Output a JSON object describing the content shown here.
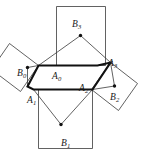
{
  "figure": {
    "kind": "geometry-diagram",
    "canvas": {
      "width": 143,
      "height": 157,
      "background": "#ffffff"
    },
    "style": {
      "hexagon_stroke": "#111111",
      "hexagon_stroke_width": 2.1,
      "square_stroke": "#3a3a3a",
      "square_stroke_width": 0.8,
      "dot_color": "#111111",
      "dot_radius": 1.7
    },
    "vertex_labels": [
      {
        "id": "A0",
        "base": "A",
        "sub": "0",
        "x": 52,
        "y": 72
      },
      {
        "id": "A1",
        "base": "A",
        "sub": "1",
        "x": 27,
        "y": 96
      },
      {
        "id": "A2",
        "base": "A",
        "sub": "2",
        "x": 79,
        "y": 84
      },
      {
        "id": "A3",
        "base": "A",
        "sub": "3",
        "x": 108,
        "y": 59
      }
    ],
    "center_labels": [
      {
        "id": "B0",
        "base": "B",
        "sub": "0",
        "x": 17,
        "y": 69
      },
      {
        "id": "B1",
        "base": "B",
        "sub": "1",
        "x": 61,
        "y": 139
      },
      {
        "id": "B2",
        "base": "B",
        "sub": "2",
        "x": 110,
        "y": 93
      },
      {
        "id": "B3",
        "base": "B",
        "sub": "3",
        "x": 72,
        "y": 20
      }
    ],
    "hexagon_path": "M 38.5,65.5 L 97.5,65.5 L 110.5,62.5 L 92.5,89.5 L 33.5,89.5 L 27.5,86.5 Z",
    "hexagon_points": [
      {
        "name": "A0-top-left",
        "x": 38.5,
        "y": 65.5
      },
      {
        "name": "top-right",
        "x": 97.5,
        "y": 65.5
      },
      {
        "name": "A3",
        "x": 110.5,
        "y": 62.5
      },
      {
        "name": "A2-right",
        "x": 92.5,
        "y": 89.5
      },
      {
        "name": "bottom-left",
        "x": 33.5,
        "y": 89.5
      },
      {
        "name": "A1",
        "x": 27.5,
        "y": 86.5
      }
    ],
    "squares": [
      {
        "id": "square-top",
        "center_label": "B3",
        "points": "56.5,6.5 105.5,6.5 105.5,65.5 38.5,65.5",
        "path": "M 56.5,6.5 L 105.5,6.5 L 105.5,65.5 L 56.5,65.5 Z"
      },
      {
        "id": "square-bottom",
        "center_label": "B1",
        "path": "M 38.5,89.5 L 92.5,89.5 L 92.5,148.5 L 38.5,148.5 Z"
      },
      {
        "id": "square-left-tilted",
        "center_label": "B0",
        "path": "M 38.5,65.5 L 9.5,43.5 L -8.5,69.5 L 20.5,91.5 Z"
      },
      {
        "id": "square-right-tilted",
        "center_label": "B2",
        "path": "M 110.5,62.5 L 137.5,83.5 L 118.5,110.5 L 91.5,89.5 Z"
      }
    ],
    "center_dots": [
      {
        "for": "B0",
        "x": 27.5,
        "y": 67.5
      },
      {
        "for": "B1",
        "x": 61.0,
        "y": 124.5
      },
      {
        "for": "B2",
        "x": 114.5,
        "y": 86.0
      },
      {
        "for": "B3",
        "x": 80.5,
        "y": 35.5
      }
    ],
    "spokes": [
      {
        "from": "B3",
        "to": "hex-A0",
        "x1": 80.5,
        "y1": 35.5,
        "x2": 38.5,
        "y2": 65.5
      },
      {
        "from": "B3",
        "to": "hex-A3",
        "x1": 80.5,
        "y1": 35.5,
        "x2": 110.5,
        "y2": 62.5
      },
      {
        "from": "B1",
        "to": "hex-A1",
        "x1": 61.0,
        "y1": 124.5,
        "x2": 33.5,
        "y2": 89.5
      },
      {
        "from": "B1",
        "to": "hex-A2",
        "x1": 61.0,
        "y1": 124.5,
        "x2": 92.5,
        "y2": 89.5
      },
      {
        "from": "B0",
        "to": "hex-A0",
        "x1": 27.5,
        "y1": 67.5,
        "x2": 38.5,
        "y2": 65.5
      },
      {
        "from": "B0",
        "to": "hex-A1",
        "x1": 27.5,
        "y1": 67.5,
        "x2": 27.5,
        "y2": 86.5
      },
      {
        "from": "B2",
        "to": "hex-A3",
        "x1": 114.5,
        "y1": 86.0,
        "x2": 110.5,
        "y2": 62.5
      },
      {
        "from": "B2",
        "to": "hex-A2",
        "x1": 114.5,
        "y1": 86.0,
        "x2": 92.5,
        "y2": 89.5
      }
    ]
  }
}
